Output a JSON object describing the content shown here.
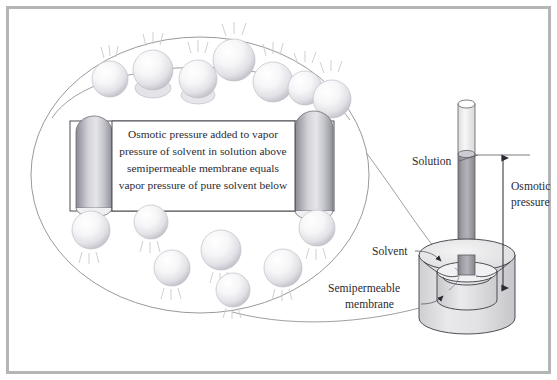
{
  "figure": {
    "frame_color": "#b5b5b5",
    "background": "#ffffff"
  },
  "callout": {
    "body_text_lines": [
      "Osmotic pressure added to vapor",
      "pressure of solvent in solution above",
      "semipermeable membrane equals",
      "vapor pressure of pure solvent below"
    ],
    "box_fill": "#ffffff",
    "box_stroke": "#3b3b42"
  },
  "labels": {
    "solution": "Solution",
    "osmotic_pressure_line1": "Osmotic",
    "osmotic_pressure_line2": "pressure",
    "solvent": "Solvent",
    "membrane_line1": "Semipermeable",
    "membrane_line2": "membrane"
  },
  "colors": {
    "sphere_light": "#ffffff",
    "sphere_mid": "#ededf0",
    "sphere_dark": "#bcbcc4",
    "post_light": "#e4e4e8",
    "post_mid": "#b0b0b8",
    "post_dark": "#7e7e86",
    "tube_fill": "#9a9a9f",
    "tube_empty": "#f2f2f4",
    "beaker_fill": "#dededf",
    "beaker_top": "#ececee",
    "membrane_fill": "#d3d3d6",
    "ink": "#2b2b33"
  },
  "apparatus": {
    "tube_label": "capillary-tube",
    "beaker_label": "beaker",
    "membrane_label": "semipermeable-membrane-cylinder",
    "arrow_label": "osmotic-pressure-arrow"
  },
  "magnifier": {
    "vapor_spheres_top_count": 7,
    "vapor_spheres_bottom_count": 7,
    "posts_count": 2
  }
}
